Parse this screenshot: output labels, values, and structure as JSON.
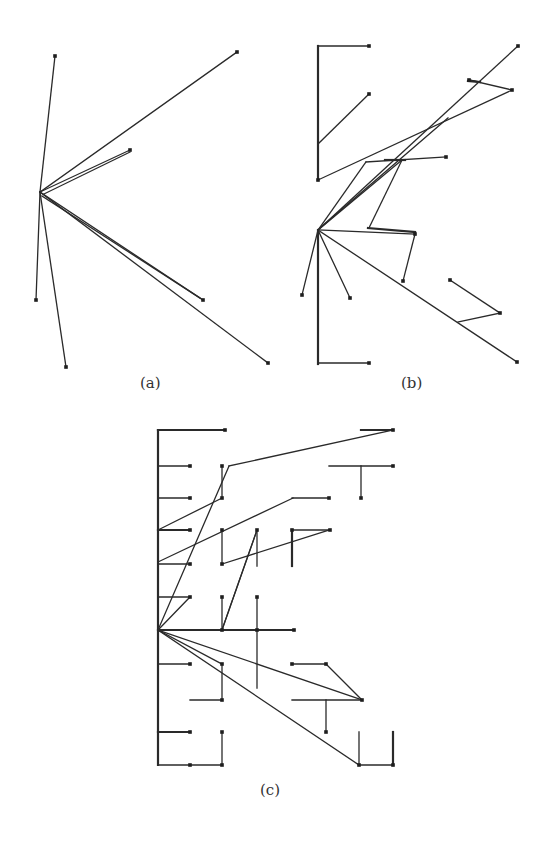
{
  "figure": {
    "panels": [
      {
        "id": "a",
        "caption": "(a)"
      },
      {
        "id": "b",
        "caption": "(b)"
      },
      {
        "id": "c",
        "caption": "(c)"
      }
    ]
  },
  "diagrams": {
    "a": {
      "segments": [
        [
          40,
          192,
          55,
          56
        ],
        [
          40,
          192,
          237,
          52
        ],
        [
          40,
          192,
          130,
          150
        ],
        [
          40,
          192,
          203,
          300
        ],
        [
          40,
          192,
          268,
          363
        ],
        [
          40,
          192,
          36,
          300
        ],
        [
          40,
          192,
          66,
          367
        ],
        [
          42,
          196,
          200,
          298
        ],
        [
          44,
          194,
          130,
          152
        ]
      ],
      "thick": [],
      "dots": [
        [
          55,
          56
        ],
        [
          237,
          52
        ],
        [
          130,
          150
        ],
        [
          203,
          300
        ],
        [
          268,
          363
        ],
        [
          36,
          300
        ],
        [
          66,
          367
        ]
      ]
    },
    "b": {
      "segments": [
        [
          369,
          46,
          318,
          46
        ],
        [
          318,
          144,
          369,
          94
        ],
        [
          318,
          180,
          512,
          90
        ],
        [
          318,
          230,
          518,
          46
        ],
        [
          318,
          230,
          402,
          160
        ],
        [
          320,
          228,
          448,
          118
        ],
        [
          366,
          162,
          446,
          157
        ],
        [
          366,
          162,
          318,
          230
        ],
        [
          402,
          160,
          369,
          228
        ],
        [
          318,
          230,
          415,
          234
        ],
        [
          415,
          234,
          403,
          281
        ],
        [
          318,
          230,
          302,
          295
        ],
        [
          318,
          230,
          350,
          298
        ],
        [
          318,
          230,
          517,
          362
        ],
        [
          450,
          280,
          500,
          313
        ],
        [
          500,
          313,
          458,
          322
        ],
        [
          469,
          80,
          512,
          90
        ],
        [
          469,
          80,
          480,
          82
        ],
        [
          318,
          363,
          369,
          363
        ]
      ],
      "thick": [
        [
          318,
          46,
          318,
          180
        ],
        [
          318,
          230,
          318,
          364
        ],
        [
          385,
          160,
          405,
          160
        ],
        [
          368,
          228,
          415,
          232
        ],
        [
          468,
          81,
          480,
          82
        ]
      ],
      "dots": [
        [
          369,
          46
        ],
        [
          318,
          180
        ],
        [
          369,
          94
        ],
        [
          518,
          46
        ],
        [
          512,
          90
        ],
        [
          469,
          80
        ],
        [
          446,
          157
        ],
        [
          415,
          234
        ],
        [
          403,
          281
        ],
        [
          302,
          295
        ],
        [
          350,
          298
        ],
        [
          517,
          362
        ],
        [
          450,
          280
        ],
        [
          500,
          313
        ],
        [
          369,
          363
        ]
      ]
    },
    "c": {
      "segments": [
        [
          158,
          466,
          190,
          466
        ],
        [
          222,
          466,
          222,
          498
        ],
        [
          158,
          498,
          190,
          498
        ],
        [
          158,
          530,
          190,
          530
        ],
        [
          222,
          530,
          222,
          564
        ],
        [
          158,
          564,
          190,
          564
        ],
        [
          257,
          530,
          257,
          566
        ],
        [
          158,
          597,
          190,
          597
        ],
        [
          222,
          597,
          222,
          630
        ],
        [
          257,
          597,
          257,
          688
        ],
        [
          158,
          630,
          294,
          630
        ],
        [
          158,
          664,
          190,
          664
        ],
        [
          222,
          664,
          222,
          700
        ],
        [
          190,
          700,
          222,
          700
        ],
        [
          158,
          732,
          190,
          732
        ],
        [
          222,
          732,
          222,
          765
        ],
        [
          158,
          765,
          222,
          765
        ],
        [
          292,
          530,
          292,
          566
        ],
        [
          292,
          530,
          330,
          530
        ],
        [
          292,
          664,
          326,
          664
        ],
        [
          326,
          664,
          362,
          700
        ],
        [
          292,
          700,
          362,
          700
        ],
        [
          326,
          700,
          326,
          732
        ],
        [
          359,
          732,
          359,
          765
        ],
        [
          359,
          765,
          393,
          765
        ],
        [
          393,
          732,
          393,
          765
        ],
        [
          329,
          466,
          393,
          466
        ],
        [
          361,
          466,
          361,
          498
        ],
        [
          292,
          498,
          329,
          498
        ],
        [
          158,
          562,
          293,
          498
        ],
        [
          158,
          530,
          222,
          498
        ],
        [
          158,
          630,
          229,
          466
        ],
        [
          229,
          466,
          393,
          430
        ],
        [
          158,
          630,
          222,
          630
        ],
        [
          222,
          630,
          257,
          530
        ],
        [
          222,
          564,
          329,
          530
        ],
        [
          158,
          630,
          222,
          664
        ],
        [
          158,
          630,
          362,
          700
        ],
        [
          158,
          630,
          359,
          765
        ],
        [
          222,
          630,
          257,
          530
        ],
        [
          190,
          597,
          158,
          630
        ]
      ],
      "thick": [
        [
          158,
          430,
          158,
          765
        ],
        [
          158,
          430,
          225,
          430
        ],
        [
          361,
          430,
          393,
          430
        ],
        [
          158,
          530,
          190,
          530
        ],
        [
          158,
          630,
          294,
          630
        ],
        [
          158,
          732,
          190,
          732
        ],
        [
          393,
          732,
          393,
          765
        ],
        [
          292,
          530,
          292,
          566
        ]
      ],
      "dots": [
        [
          225,
          430
        ],
        [
          393,
          430
        ],
        [
          190,
          466
        ],
        [
          222,
          466
        ],
        [
          190,
          498
        ],
        [
          222,
          498
        ],
        [
          190,
          530
        ],
        [
          222,
          530
        ],
        [
          190,
          564
        ],
        [
          222,
          564
        ],
        [
          257,
          530
        ],
        [
          292,
          530
        ],
        [
          330,
          530
        ],
        [
          393,
          466
        ],
        [
          361,
          498
        ],
        [
          329,
          498
        ],
        [
          190,
          597
        ],
        [
          222,
          597
        ],
        [
          257,
          597
        ],
        [
          294,
          630
        ],
        [
          222,
          630
        ],
        [
          257,
          630
        ],
        [
          190,
          664
        ],
        [
          222,
          664
        ],
        [
          222,
          700
        ],
        [
          292,
          664
        ],
        [
          326,
          664
        ],
        [
          362,
          700
        ],
        [
          326,
          732
        ],
        [
          190,
          732
        ],
        [
          222,
          732
        ],
        [
          222,
          765
        ],
        [
          359,
          765
        ],
        [
          393,
          765
        ],
        [
          190,
          765
        ]
      ]
    }
  }
}
